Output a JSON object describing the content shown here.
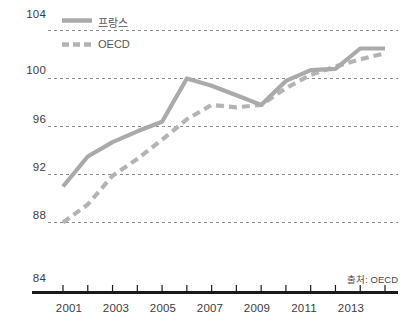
{
  "chart_data": {
    "type": "line",
    "title": "",
    "subtitle": "",
    "xlabel": "",
    "ylabel": "",
    "xlim": [
      2001,
      2014
    ],
    "ylim": [
      84,
      104
    ],
    "grid": true,
    "grid_style": "dashed-horizontal",
    "legend_position": "top-left",
    "source": "출처: OECD",
    "y_ticks": [
      "104",
      "100",
      "96",
      "92",
      "88",
      "84"
    ],
    "y_tick_values": [
      104,
      100,
      96,
      92,
      88,
      84
    ],
    "x_ticks": [
      "2001",
      "2003",
      "2005",
      "2007",
      "2009",
      "2011",
      "2013"
    ],
    "x_tick_values": [
      2001,
      2003,
      2005,
      2007,
      2009,
      2011,
      2013
    ],
    "x_minor_tick_values": [
      2002,
      2004,
      2006,
      2008,
      2010,
      2012,
      2014
    ],
    "x": [
      2001,
      2002,
      2003,
      2004,
      2005,
      2006,
      2007,
      2008,
      2009,
      2010,
      2011,
      2012,
      2013,
      2014
    ],
    "series": [
      {
        "name": "프랑스",
        "style": "solid",
        "color": "#aaaaaa",
        "values": [
          91.0,
          93.5,
          94.7,
          95.6,
          96.4,
          100.0,
          99.4,
          98.6,
          97.8,
          99.8,
          100.7,
          100.8,
          102.5,
          102.5
        ]
      },
      {
        "name": "OECD",
        "style": "dashed",
        "color": "#b4b4b4",
        "values": [
          88.0,
          89.5,
          91.9,
          93.3,
          94.9,
          96.6,
          97.8,
          97.6,
          97.8,
          99.2,
          100.3,
          101.0,
          101.6,
          102.1
        ]
      }
    ],
    "legend": [
      {
        "label": "프랑스",
        "style": "solid",
        "color": "#aaaaaa"
      },
      {
        "label": "OECD",
        "style": "dashed",
        "color": "#b4b4b4"
      }
    ]
  },
  "colors": {
    "line_france": "#aaaaaa",
    "line_oecd": "#b4b4b4",
    "gridline": "#8c8c8c",
    "axis": "#1a1a1a",
    "tick_text": "#3c3c3c",
    "legend_text": "#565656",
    "background": "#ffffff"
  },
  "axis": {
    "y_labels": [
      "104",
      "100",
      "96",
      "92",
      "88",
      "84"
    ],
    "x_labels": [
      "2001",
      "2003",
      "2005",
      "2007",
      "2009",
      "2011",
      "2013"
    ]
  },
  "legend": {
    "france_label": "프랑스",
    "oecd_label": "OECD"
  },
  "footer": {
    "source_text": "출처: OECD"
  }
}
